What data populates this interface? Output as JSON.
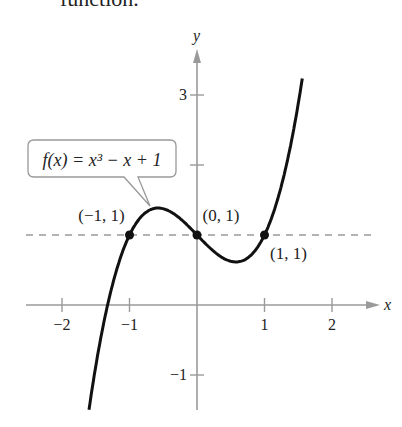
{
  "caption": "function.",
  "chart_data": {
    "type": "line",
    "title": "",
    "function_label": "f(x) = x³ − x + 1",
    "xlabel": "x",
    "ylabel": "y",
    "xlim": [
      -2.5,
      2.6
    ],
    "ylim": [
      -1.3,
      3.8
    ],
    "x_ticks": [
      -2,
      -1,
      1,
      2
    ],
    "x_tick_labels": [
      "−2",
      "−1",
      "1",
      "2"
    ],
    "y_ticks": [
      -1,
      2,
      3
    ],
    "y_tick_labels": [
      "−1",
      "",
      "3"
    ],
    "dashed_line": {
      "y": 1
    },
    "points": [
      {
        "x": -1,
        "y": 1,
        "label": "(−1, 1)"
      },
      {
        "x": 0,
        "y": 1,
        "label": "(0, 1)"
      },
      {
        "x": 1,
        "y": 1,
        "label": "(1, 1)"
      }
    ],
    "series": [
      {
        "name": "f(x) = x^3 - x + 1",
        "x_range": [
          -1.6,
          1.56
        ]
      }
    ],
    "grid": false
  }
}
